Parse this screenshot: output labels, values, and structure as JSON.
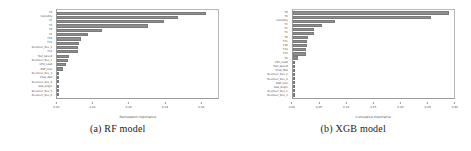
{
  "figure": {
    "subfigures": [
      {
        "caption": "(a) RF model",
        "chart_index": 0
      },
      {
        "caption": "(b) XGB model",
        "chart_index": 1
      }
    ]
  },
  "chart_data": [
    {
      "type": "bar",
      "orientation": "horizontal",
      "title": "",
      "xlabel": "Permutation Importance",
      "ylabel": "",
      "xlim": [
        0.0,
        0.045
      ],
      "xticks": [
        0.0,
        0.01,
        0.02,
        0.03,
        0.04
      ],
      "xticklabels": [
        "0.00",
        "0.01",
        "0.02",
        "0.03",
        "0.04"
      ],
      "grid": false,
      "legend": false,
      "bar_color": "#8e8e8e",
      "categories": [
        "T4",
        "Humidity",
        "T2",
        "T3",
        "T9",
        "T1",
        "T10",
        "T11",
        "Revolver_Rev_1",
        "T12",
        "Tool_Speed",
        "Revolver_Rev_2",
        "CPU_Load",
        "DSP_Link",
        "Revolver_Rev_3",
        "Chat_Mat",
        "Revolver_Rev_4",
        "Stat_Angle",
        "Revolver_Rev_5",
        "Revolver_Rev_6"
      ],
      "values": [
        0.0415,
        0.0337,
        0.0299,
        0.0255,
        0.0125,
        0.0087,
        0.0067,
        0.0062,
        0.0058,
        0.0057,
        0.0032,
        0.0029,
        0.0024,
        0.0017,
        0.0006,
        0.0005,
        0.0004,
        0.0003,
        0.0002,
        0.0001
      ]
    },
    {
      "type": "bar",
      "orientation": "horizontal",
      "title": "",
      "xlabel": "Cumulative Importance",
      "ylabel": "",
      "xlim": [
        0.0,
        0.3
      ],
      "xticks": [
        0.0,
        0.05,
        0.1,
        0.15,
        0.2,
        0.25,
        0.3
      ],
      "xticklabels": [
        "0.00",
        "0.05",
        "0.10",
        "0.15",
        "0.20",
        "0.25",
        "0.30"
      ],
      "grid": false,
      "legend": false,
      "bar_color": "#8e8e8e",
      "categories": [
        "T9",
        "T4",
        "Humidity",
        "T2",
        "T1",
        "T3",
        "T6",
        "T11",
        "T10",
        "T14",
        "T13",
        "T8",
        "CPU_Load",
        "Tool_Speed",
        "Chat_Mat",
        "Revolver_Rev_2",
        "Revolver_Rev_4",
        "DSP_Link",
        "Stat_Angle",
        "Revolver_Rev_1",
        "Revolver_Rev_3"
      ],
      "values": [
        0.291,
        0.258,
        0.079,
        0.054,
        0.04,
        0.039,
        0.029,
        0.026,
        0.026,
        0.025,
        0.024,
        0.009,
        0.004,
        0.003,
        0.003,
        0.002,
        0.002,
        0.002,
        0.001,
        0.001,
        0.001
      ]
    }
  ]
}
